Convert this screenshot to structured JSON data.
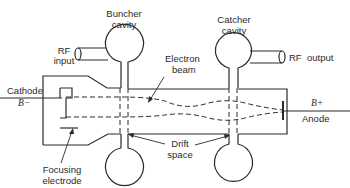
{
  "diagram": {
    "type": "klystron-schematic",
    "labels": {
      "buncher_cavity_line1": "Buncher",
      "buncher_cavity_line2": "cavity",
      "catcher_cavity_line1": "Catcher",
      "catcher_cavity_line2": "cavity",
      "rf_input_line1": "RF",
      "rf_input_line2": "input",
      "rf_output": "RF  output",
      "cathode": "Cathode",
      "cathode_voltage": "B−",
      "electron_beam_line1": "Electron",
      "electron_beam_line2": "beam",
      "anode_voltage": "B+",
      "anode": "Anode",
      "drift_space_line1": "Drift",
      "drift_space_line2": "space",
      "focusing_electrode_line1": "Focusing",
      "focusing_electrode_line2": "electrode"
    },
    "components": [
      "buncher-cavity",
      "catcher-cavity",
      "rf-input-coupler",
      "rf-output-coupler",
      "cathode",
      "focusing-electrode",
      "electron-beam",
      "drift-space",
      "anode"
    ],
    "colors": {
      "ink": "#2a2a2a",
      "background": "#ffffff"
    }
  }
}
